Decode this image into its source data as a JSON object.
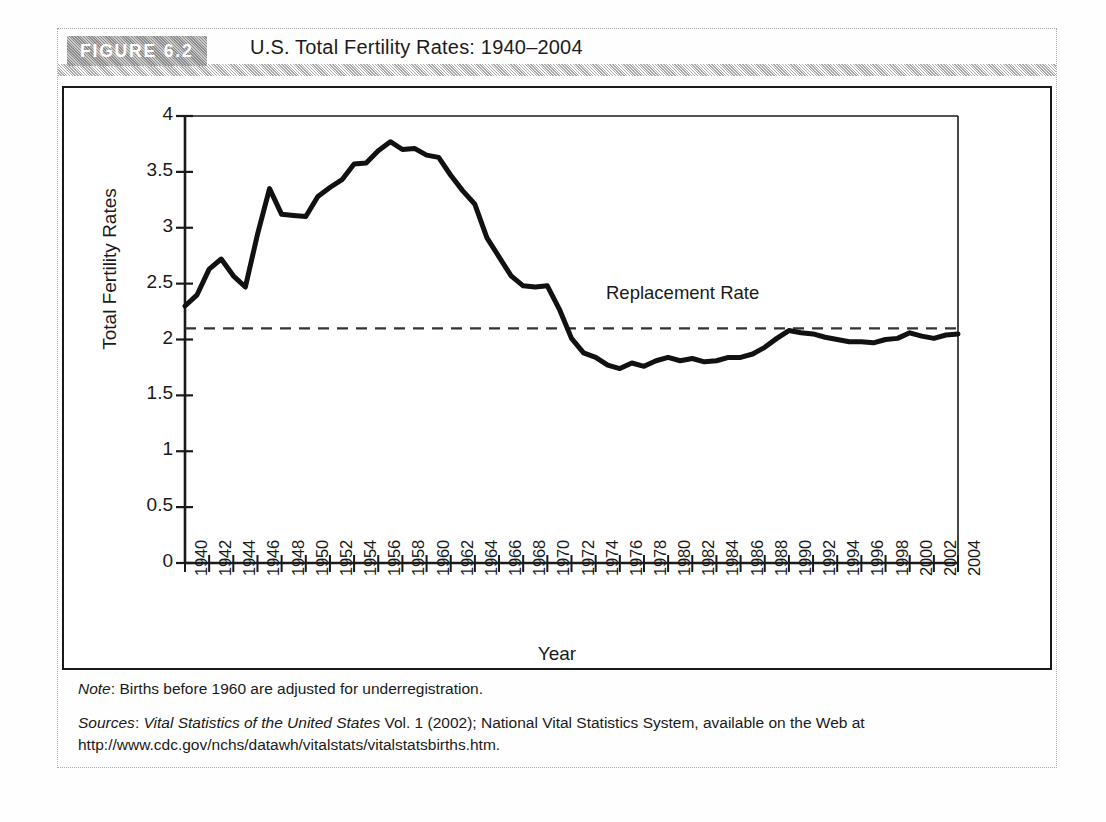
{
  "figure": {
    "badge_label": "FIGURE 6.2",
    "title": "U.S. Total Fertility Rates: 1940–2004"
  },
  "notes": {
    "note_prefix": "Note",
    "note_sep": ": ",
    "note_text": "Births before 1960 are adjusted for underregistration.",
    "sources_prefix": "Sources",
    "sources_sep": ": ",
    "sources_italic": "Vital Statistics of the United States",
    "sources_rest": " Vol. 1 (2002); National Vital Statistics System, available on the Web at",
    "sources_url": "http://www.cdc.gov/nchs/datawh/vitalstats/vitalstatsbirths.htm."
  },
  "colors": {
    "line": "#111111",
    "axis": "#1a1a1a",
    "dashed": "#333333",
    "badge_gray": "#9d9d9d",
    "frame_gray": "#a8a8a8"
  },
  "chart_data": {
    "type": "line",
    "title": "U.S. Total Fertility Rates: 1940–2004",
    "xlabel": "Year",
    "ylabel": "Total Fertility Rates",
    "xlim": [
      1940,
      2004
    ],
    "ylim": [
      0,
      4
    ],
    "yticks": [
      0,
      0.5,
      1,
      1.5,
      2,
      2.5,
      3,
      3.5,
      4
    ],
    "ytick_labels": [
      "0",
      "0.5",
      "1",
      "1.5",
      "2",
      "2.5",
      "3",
      "3.5",
      "4"
    ],
    "xtick_labels": [
      "1940",
      "1942",
      "1944",
      "1946",
      "1948",
      "1950",
      "1952",
      "1954",
      "1956",
      "1958",
      "1960",
      "1962",
      "1964",
      "1966",
      "1968",
      "1970",
      "1972",
      "1974",
      "1976",
      "1978",
      "1980",
      "1982",
      "1984",
      "1986",
      "1988",
      "1990",
      "1992",
      "1994",
      "1996",
      "1998",
      "2000",
      "2002",
      "2004"
    ],
    "grid": false,
    "legend_position": "none",
    "annotations": [
      {
        "text": "Replacement Rate",
        "value": 2.1,
        "kind": "dashed-hline-label"
      }
    ],
    "reference_lines": [
      {
        "label": "Replacement Rate",
        "y": 2.1,
        "style": "dashed"
      }
    ],
    "x": [
      1940,
      1941,
      1942,
      1943,
      1944,
      1945,
      1946,
      1947,
      1948,
      1949,
      1950,
      1951,
      1952,
      1953,
      1954,
      1955,
      1956,
      1957,
      1958,
      1959,
      1960,
      1961,
      1962,
      1963,
      1964,
      1965,
      1966,
      1967,
      1968,
      1969,
      1970,
      1971,
      1972,
      1973,
      1974,
      1975,
      1976,
      1977,
      1978,
      1979,
      1980,
      1981,
      1982,
      1983,
      1984,
      1985,
      1986,
      1987,
      1988,
      1989,
      1990,
      1991,
      1992,
      1993,
      1994,
      1995,
      1996,
      1997,
      1998,
      1999,
      2000,
      2001,
      2002,
      2003,
      2004
    ],
    "series": [
      {
        "name": "Total Fertility Rate",
        "values": [
          2.3,
          2.4,
          2.63,
          2.72,
          2.57,
          2.47,
          2.94,
          3.35,
          3.12,
          3.11,
          3.1,
          3.28,
          3.36,
          3.43,
          3.57,
          3.58,
          3.69,
          3.77,
          3.7,
          3.71,
          3.65,
          3.63,
          3.47,
          3.33,
          3.21,
          2.91,
          2.74,
          2.57,
          2.48,
          2.47,
          2.48,
          2.27,
          2.01,
          1.88,
          1.84,
          1.77,
          1.74,
          1.79,
          1.76,
          1.81,
          1.84,
          1.81,
          1.83,
          1.8,
          1.81,
          1.84,
          1.84,
          1.87,
          1.93,
          2.01,
          2.08,
          2.06,
          2.05,
          2.02,
          2.0,
          1.98,
          1.98,
          1.97,
          2.0,
          2.01,
          2.06,
          2.03,
          2.01,
          2.04,
          2.05
        ]
      }
    ]
  }
}
